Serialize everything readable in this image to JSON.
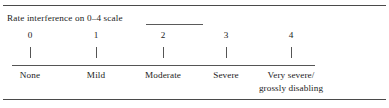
{
  "document": {
    "prompt": "Rate interference on 0–4 scale",
    "has_blank_fill_line": true
  },
  "scale": {
    "points": [
      {
        "number": "0",
        "label_line1": "None",
        "label_line2": "",
        "x": 30
      },
      {
        "number": "1",
        "label_line1": "Mild",
        "label_line2": "",
        "x": 96
      },
      {
        "number": "2",
        "label_line1": "Moderate",
        "label_line2": "",
        "x": 163
      },
      {
        "number": "3",
        "label_line1": "Severe",
        "label_line2": "",
        "x": 226
      },
      {
        "number": "4",
        "label_line1": "Very severe/",
        "label_line2": "grossly disabling",
        "x": 291
      }
    ]
  },
  "colors": {
    "text": "#1c1c1c",
    "rule": "#4a4a4a",
    "scale_rule": "#555555",
    "background": "#ffffff"
  }
}
